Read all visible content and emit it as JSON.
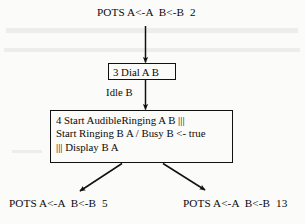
{
  "diagram": {
    "type": "state-transition-flow",
    "title_node": {
      "label": "POTS A<-A  B<-B  2"
    },
    "nodes": [
      {
        "id": "node-3",
        "label": "3 Dial A B",
        "shape": "rectangle"
      },
      {
        "id": "node-4",
        "lines": [
          "4 Start AudibleRinging A B |||",
          "Start Ringing B A / Busy B <- true",
          "||| Display B A"
        ],
        "shape": "rectangle"
      }
    ],
    "edges": [
      {
        "id": "edge-top",
        "label": "",
        "from": "POTS A<-A  B<-B  2",
        "to": "3 Dial A B"
      },
      {
        "id": "edge-idle",
        "label": "Idle B",
        "from": "3 Dial A B",
        "to": "4 Start AudibleRinging A B"
      },
      {
        "id": "edge-left",
        "label": "",
        "from": "4 Start AudibleRinging A B",
        "to": "POTS A<-A  B<-B  5"
      },
      {
        "id": "edge-right",
        "label": "",
        "from": "4 Start AudibleRinging A B",
        "to": "POTS A<-A  B<-B  13"
      }
    ],
    "leaf_labels": [
      {
        "id": "leaf-left",
        "label": "POTS A<-A  B<-B  5"
      },
      {
        "id": "leaf-right",
        "label": "POTS A<-A  B<-B  13"
      }
    ],
    "colors": {
      "stroke": "#111111",
      "text": "#0a0a0a",
      "background": "#fbfbf9"
    }
  }
}
